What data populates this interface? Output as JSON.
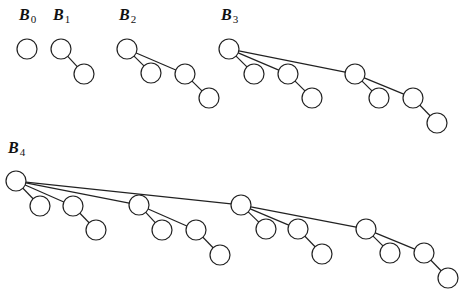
{
  "style": {
    "stroke": "#222222",
    "fill": "#ffffff",
    "node_radius": 10
  },
  "trees": [
    {
      "id": "B0",
      "label": {
        "base": "B",
        "sub": "0",
        "x": 19,
        "y": 20
      },
      "nodes": [
        [
          27,
          49
        ]
      ],
      "edges": []
    },
    {
      "id": "B1",
      "label": {
        "base": "B",
        "sub": "1",
        "x": 53,
        "y": 20
      },
      "nodes": [
        [
          61,
          49
        ],
        [
          84,
          74
        ]
      ],
      "edges": [
        [
          0,
          1
        ]
      ]
    },
    {
      "id": "B2",
      "label": {
        "base": "B",
        "sub": "2",
        "x": 119,
        "y": 20
      },
      "nodes": [
        [
          127,
          49
        ],
        [
          151,
          73
        ],
        [
          185,
          74
        ],
        [
          209,
          98
        ]
      ],
      "edges": [
        [
          0,
          1
        ],
        [
          0,
          2
        ],
        [
          2,
          3
        ]
      ]
    },
    {
      "id": "B3",
      "label": {
        "base": "B",
        "sub": "3",
        "x": 221,
        "y": 20
      },
      "nodes": [
        [
          229,
          49
        ],
        [
          254,
          74
        ],
        [
          288,
          74
        ],
        [
          312,
          98
        ],
        [
          355,
          74
        ],
        [
          379,
          98
        ],
        [
          413,
          98
        ],
        [
          437,
          123
        ]
      ],
      "edges": [
        [
          0,
          1
        ],
        [
          0,
          2
        ],
        [
          2,
          3
        ],
        [
          0,
          4
        ],
        [
          4,
          5
        ],
        [
          4,
          6
        ],
        [
          6,
          7
        ]
      ]
    },
    {
      "id": "B4",
      "label": {
        "base": "B",
        "sub": "4",
        "x": 8,
        "y": 153
      },
      "nodes": [
        [
          16,
          181
        ],
        [
          40,
          206
        ],
        [
          73,
          206
        ],
        [
          96,
          230
        ],
        [
          139,
          205
        ],
        [
          162,
          230
        ],
        [
          196,
          230
        ],
        [
          220,
          255
        ],
        [
          241,
          205
        ],
        [
          266,
          229
        ],
        [
          298,
          229
        ],
        [
          322,
          254
        ],
        [
          366,
          229
        ],
        [
          390,
          253
        ],
        [
          424,
          253
        ],
        [
          448,
          278
        ]
      ],
      "edges": [
        [
          0,
          1
        ],
        [
          0,
          2
        ],
        [
          2,
          3
        ],
        [
          0,
          4
        ],
        [
          4,
          5
        ],
        [
          4,
          6
        ],
        [
          6,
          7
        ],
        [
          0,
          8
        ],
        [
          8,
          9
        ],
        [
          8,
          10
        ],
        [
          10,
          11
        ],
        [
          8,
          12
        ],
        [
          12,
          13
        ],
        [
          12,
          14
        ],
        [
          14,
          15
        ]
      ]
    }
  ]
}
